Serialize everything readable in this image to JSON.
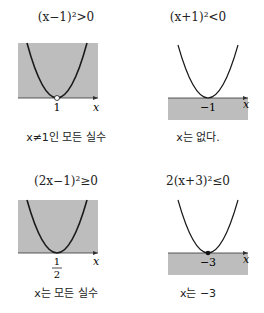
{
  "panels": [
    {
      "title": "(x−1)²>0",
      "vertex_label": "1",
      "axis_label": "x",
      "caption": "x≠1인 모든 실수",
      "shade": "above",
      "vertex_marker": "open"
    },
    {
      "title": "(x+1)²<0",
      "vertex_label": "−1",
      "axis_label": "x",
      "caption": "x는 없다.",
      "shade": "below",
      "vertex_marker": "none"
    },
    {
      "title": "(2x−1)²≥0",
      "vertex_label_num": "1",
      "vertex_label_den": "2",
      "axis_label": "x",
      "caption": "x는 모든 실수",
      "shade": "above",
      "vertex_marker": "none"
    },
    {
      "title": "2(x+3)²≤0",
      "vertex_label": "−3",
      "axis_label": "x",
      "caption": "x는 −3",
      "shade": "below",
      "vertex_marker": "filled"
    }
  ],
  "colors": {
    "shade": "#bdbdbd",
    "curve": "#1a1a1a",
    "axis": "#333333"
  }
}
